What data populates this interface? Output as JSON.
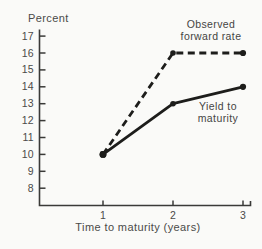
{
  "colors": {
    "background": "#fafaf8",
    "axis": "#3a3a38",
    "line": "#1d1d1b",
    "text": "#4a4a48"
  },
  "chart_data": {
    "type": "line",
    "title": "",
    "ylabel": "Percent",
    "xlabel": "Time to maturity (years)",
    "x": [
      1,
      2,
      3
    ],
    "xticks": [
      1,
      2,
      3
    ],
    "yticks": [
      17,
      16,
      15,
      14,
      13,
      12,
      11,
      10,
      9,
      8
    ],
    "ylim": [
      8,
      17
    ],
    "xlim": [
      0,
      3
    ],
    "grid": false,
    "legend_position": "inline-annotations",
    "series": [
      {
        "name": "Observed forward rate",
        "style": "dashed",
        "values": [
          10,
          16,
          16
        ]
      },
      {
        "name": "Yield to maturity",
        "style": "solid",
        "values": [
          10,
          13,
          14
        ]
      }
    ],
    "annotations": [
      {
        "lines": [
          "Observed",
          "forward rate"
        ]
      },
      {
        "lines": [
          "Yield to",
          "maturity"
        ]
      }
    ]
  }
}
